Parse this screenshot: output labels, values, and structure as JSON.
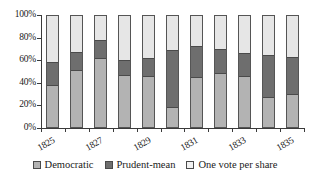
{
  "chart_data": {
    "type": "bar",
    "subtype": "stacked-100-percent",
    "title": "",
    "xlabel": "",
    "ylabel": "",
    "ylim": [
      0,
      100
    ],
    "ytick_labels": [
      "0%",
      "20%",
      "40%",
      "60%",
      "80%",
      "100%"
    ],
    "ytick_values": [
      0,
      20,
      40,
      60,
      80,
      100
    ],
    "grid": false,
    "legend_position": "bottom",
    "categories": [
      "1825",
      "1826",
      "1827",
      "1828",
      "1829",
      "1830",
      "1831",
      "1832",
      "1833",
      "1834",
      "1835"
    ],
    "xtick_labels_shown": [
      "1825",
      "1827",
      "1829",
      "1831",
      "1833",
      "1835"
    ],
    "series": [
      {
        "name": "Democratic",
        "color": "#b3b3b3",
        "values": [
          38,
          51,
          62,
          47,
          46,
          18,
          45,
          49,
          46,
          27,
          30
        ]
      },
      {
        "name": "Prudent-mean",
        "color": "#6e6e6e",
        "values": [
          21,
          17,
          16,
          13,
          16,
          51,
          28,
          21,
          21,
          38,
          33
        ]
      },
      {
        "name": "One vote per share",
        "color": "#e6e6e6",
        "values": [
          41,
          32,
          22,
          40,
          38,
          31,
          27,
          30,
          33,
          35,
          37
        ]
      }
    ]
  },
  "axis": {
    "y_ticks": [
      {
        "label": "100%",
        "value": 100
      },
      {
        "label": "80%",
        "value": 80
      },
      {
        "label": "60%",
        "value": 60
      },
      {
        "label": "40%",
        "value": 40
      },
      {
        "label": "20%",
        "value": 20
      },
      {
        "label": "0%",
        "value": 0
      }
    ],
    "x_labels": [
      {
        "label": "1825",
        "index": 0
      },
      {
        "label": "1827",
        "index": 2
      },
      {
        "label": "1829",
        "index": 4
      },
      {
        "label": "1831",
        "index": 6
      },
      {
        "label": "1833",
        "index": 8
      },
      {
        "label": "1835",
        "index": 10
      }
    ]
  },
  "legend": {
    "items": [
      {
        "label": "Democratic",
        "swatch": "democratic-swatch"
      },
      {
        "label": "Prudent-mean",
        "swatch": "prudent-mean-swatch"
      },
      {
        "label": "One vote per share",
        "swatch": "one-vote-per-share-swatch"
      }
    ]
  }
}
